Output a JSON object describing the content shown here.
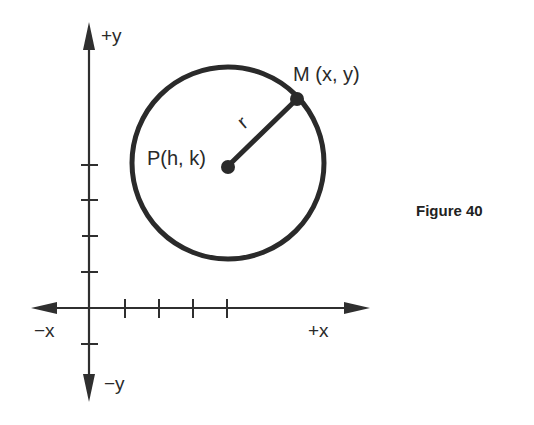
{
  "figure": {
    "caption": "Figure 40",
    "axes": {
      "x_positive": "+x",
      "x_negative": "−x",
      "y_positive": "+y",
      "y_negative": "−y"
    },
    "points": {
      "center": "P(h, k)",
      "on_circle": "M (x, y)"
    },
    "radius_label": "r",
    "colors": {
      "stroke": "#2a2a2a",
      "background": "#ffffff"
    }
  }
}
